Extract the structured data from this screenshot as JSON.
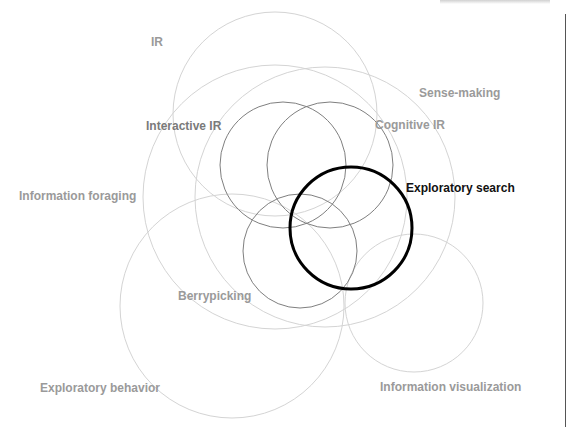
{
  "diagram": {
    "type": "venn-overlap",
    "colors": {
      "light_circle": "#d4d4d4",
      "mid_circle": "#7f7f7f",
      "focus_circle": "#000000",
      "light_label": "#9a9a9a",
      "mid_label": "#7a7a7a",
      "focus_label": "#111111"
    },
    "circles": [
      {
        "id": "ir",
        "label": "IR",
        "cx": 275,
        "cy": 114,
        "r": 102,
        "tone": "light"
      },
      {
        "id": "information-foraging",
        "label": "Information foraging",
        "cx": 275,
        "cy": 197,
        "r": 132,
        "tone": "light"
      },
      {
        "id": "sense-making",
        "label": "Sense-making",
        "cx": 325,
        "cy": 197,
        "r": 130,
        "tone": "light"
      },
      {
        "id": "exploratory-behavior",
        "label": "Exploratory behavior",
        "cx": 232,
        "cy": 306,
        "r": 112,
        "tone": "light"
      },
      {
        "id": "information-visualization",
        "label": "Information visualization",
        "cx": 414,
        "cy": 303,
        "r": 69,
        "tone": "light"
      },
      {
        "id": "interactive-ir",
        "label": "Interactive IR",
        "cx": 283,
        "cy": 165,
        "r": 63,
        "tone": "mid"
      },
      {
        "id": "cognitive-ir",
        "label": "Cognitive IR",
        "cx": 330,
        "cy": 165,
        "r": 63,
        "tone": "mid"
      },
      {
        "id": "berrypicking",
        "label": "Berrypicking",
        "cx": 300,
        "cy": 251,
        "r": 57,
        "tone": "mid"
      },
      {
        "id": "exploratory-search",
        "label": "Exploratory search",
        "cx": 351,
        "cy": 228,
        "r": 61,
        "tone": "focus"
      }
    ],
    "labels": {
      "ir": "IR",
      "sense_making": "Sense-making",
      "interactive_ir": "Interactive IR",
      "cognitive_ir": "Cognitive IR",
      "information_foraging": "Information foraging",
      "exploratory_search": "Exploratory search",
      "berrypicking": "Berrypicking",
      "exploratory_behavior": "Exploratory behavior",
      "information_visualization": "Information visualization"
    }
  }
}
